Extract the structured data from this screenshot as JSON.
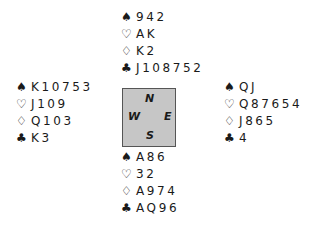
{
  "hands": {
    "north": {
      "spades": "942",
      "hearts": "AK",
      "diamonds": "K2",
      "clubs": "J108752"
    },
    "west": {
      "spades": "K10753",
      "hearts": "J109",
      "diamonds": "Q103",
      "clubs": "K3"
    },
    "east": {
      "spades": "QJ",
      "hearts": "Q87654",
      "diamonds": "J865",
      "clubs": "4"
    },
    "south": {
      "spades": "A86",
      "hearts": "32",
      "diamonds": "A974",
      "clubs": "AQ96"
    }
  },
  "suits": {
    "spades": "♠",
    "hearts": "♡",
    "diamonds": "♢",
    "clubs": "♣"
  },
  "compass": {
    "n": "N",
    "s": "S",
    "w": "W",
    "e": "E"
  },
  "colors": {
    "compass_fill": "#c6c6c6",
    "compass_border": "#555555",
    "text": "#1a1a1a"
  }
}
